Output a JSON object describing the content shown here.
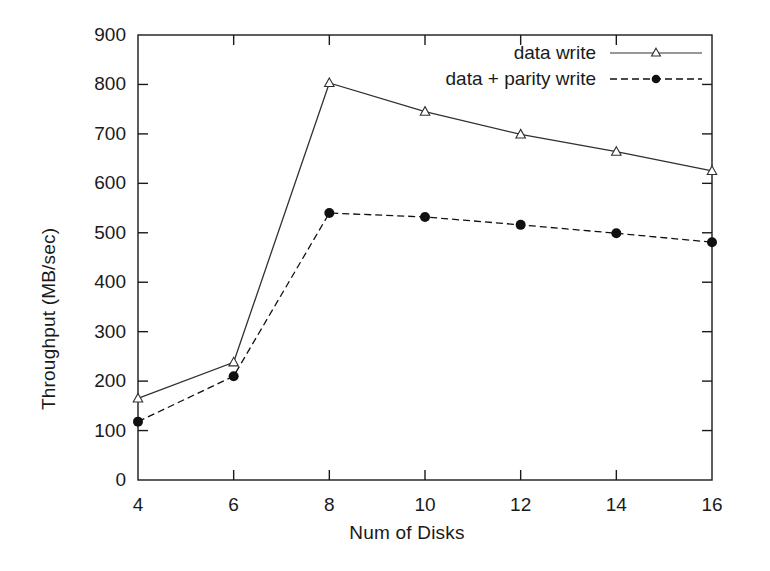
{
  "chart_data": {
    "type": "line",
    "title": "",
    "xlabel": "Num of Disks",
    "ylabel": "Throughput (MB/sec)",
    "x": [
      4,
      6,
      8,
      10,
      12,
      14,
      16
    ],
    "xlim": [
      4,
      16
    ],
    "ylim": [
      0,
      900
    ],
    "xticks": [
      "4",
      "6",
      "8",
      "10",
      "12",
      "14",
      "16"
    ],
    "yticks": [
      "0",
      "100",
      "200",
      "300",
      "400",
      "500",
      "600",
      "700",
      "800",
      "900"
    ],
    "grid": false,
    "legend_position": "top-right",
    "series": [
      {
        "name": "data write",
        "values": [
          165,
          238,
          803,
          745,
          699,
          664,
          625
        ],
        "line_style": "solid",
        "marker": "open-triangle",
        "color": "#303030"
      },
      {
        "name": "data + parity write",
        "values": [
          118,
          210,
          540,
          532,
          516,
          499,
          481
        ],
        "line_style": "dashed",
        "marker": "filled-circle",
        "color": "#101010"
      }
    ]
  },
  "legend": {
    "items": [
      {
        "label": "data write"
      },
      {
        "label": "data + parity write"
      }
    ]
  },
  "colors": {
    "background": "#ffffff",
    "axis": "#1a1a1a",
    "series_1": "#303030",
    "series_2": "#101010"
  }
}
